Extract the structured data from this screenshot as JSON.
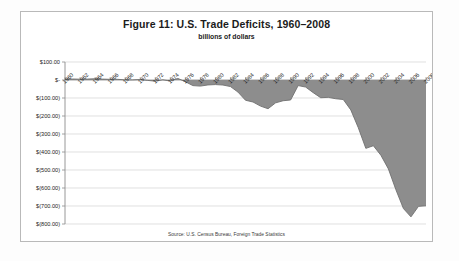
{
  "figure": {
    "title": "Figure 11: U.S. Trade Deficits, 1960–2008",
    "subtitle": "billions of dollars",
    "source_note": "Source: U.S. Census Bureau, Foreign Trade Statistics"
  },
  "colors": {
    "area_fill": "#8d8d8d",
    "area_line": "#6f6f6f",
    "gridline": "#d2d2d2",
    "axis_line": "#8c8c8c",
    "frame_border": "#b9b9b9",
    "text": "#1b1b1b",
    "page_background": "#fdfdfd",
    "plot_background": "#ffffff"
  },
  "chart_data": {
    "type": "area",
    "title": "Figure 11: U.S. Trade Deficits, 1960–2008",
    "subtitle": "billions of dollars",
    "xlabel": "",
    "ylabel": "billions of dollars",
    "ylim": [
      -800,
      100
    ],
    "xlim": [
      1960,
      2008
    ],
    "grid": true,
    "legend": false,
    "ytick_labels": [
      "$100.00",
      "$-",
      "$(100.00)",
      "$(200.00)",
      "$(300.00)",
      "$(400.00)",
      "$(500.00)",
      "$(600.00)",
      "$(700.00)",
      "$(800.00)"
    ],
    "ytick_values": [
      100,
      0,
      -100,
      -200,
      -300,
      -400,
      -500,
      -600,
      -700,
      -800
    ],
    "xtick_labels": [
      "1960",
      "1962",
      "1964",
      "1966",
      "1968",
      "1970",
      "1972",
      "1974",
      "1976",
      "1978",
      "1980",
      "1982",
      "1984",
      "1986",
      "1988",
      "1990",
      "1992",
      "1994",
      "1996",
      "1998",
      "2000",
      "2002",
      "2004",
      "2006",
      "2008"
    ],
    "x": [
      1960,
      1961,
      1962,
      1963,
      1964,
      1965,
      1966,
      1967,
      1968,
      1969,
      1970,
      1971,
      1972,
      1973,
      1974,
      1975,
      1976,
      1977,
      1978,
      1979,
      1980,
      1981,
      1982,
      1983,
      1984,
      1985,
      1986,
      1987,
      1988,
      1989,
      1990,
      1991,
      1992,
      1993,
      1994,
      1995,
      1996,
      1997,
      1998,
      1999,
      2000,
      2001,
      2002,
      2003,
      2004,
      2005,
      2006,
      2007,
      2008
    ],
    "values": [
      4.9,
      5.6,
      4.5,
      5.2,
      6.8,
      5.0,
      3.8,
      3.8,
      0.6,
      0.6,
      2.6,
      -2.3,
      -6.4,
      0.9,
      -5.5,
      8.9,
      -9.5,
      -31.1,
      -33.9,
      -27.5,
      -25.5,
      -28.0,
      -36.4,
      -67.1,
      -112.5,
      -122.2,
      -145.1,
      -159.6,
      -127.0,
      -115.2,
      -111.0,
      -31.1,
      -39.2,
      -70.3,
      -98.5,
      -96.4,
      -104.1,
      -108.3,
      -166.1,
      -265.1,
      -379.8,
      -365.1,
      -418.0,
      -493.9,
      -609.9,
      -714.2,
      -760.4,
      -702.0,
      -698.8
    ],
    "series": [
      {
        "name": "U.S. trade balance",
        "values": [
          4.9,
          5.6,
          4.5,
          5.2,
          6.8,
          5.0,
          3.8,
          3.8,
          0.6,
          0.6,
          2.6,
          -2.3,
          -6.4,
          0.9,
          -5.5,
          8.9,
          -9.5,
          -31.1,
          -33.9,
          -27.5,
          -25.5,
          -28.0,
          -36.4,
          -67.1,
          -112.5,
          -122.2,
          -145.1,
          -159.6,
          -127.0,
          -115.2,
          -111.0,
          -31.1,
          -39.2,
          -70.3,
          -98.5,
          -96.4,
          -104.1,
          -108.3,
          -166.1,
          -265.1,
          -379.8,
          -365.1,
          -418.0,
          -493.9,
          -609.9,
          -714.2,
          -760.4,
          -702.0,
          -698.8
        ]
      }
    ]
  }
}
